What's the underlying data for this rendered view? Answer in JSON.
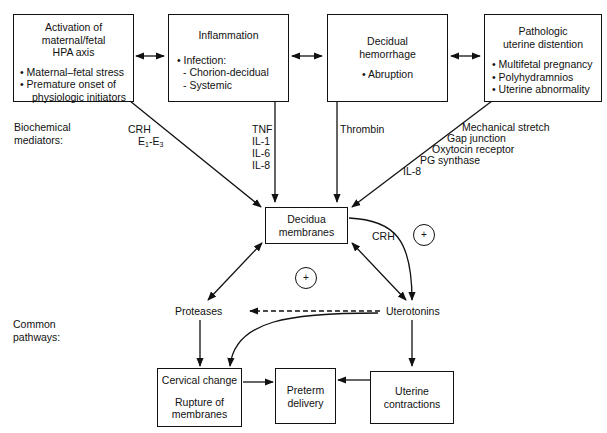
{
  "top_boxes": [
    {
      "title_lines": [
        "Activation of",
        "maternal/fetal",
        "HPA axis"
      ],
      "bullets": [
        "• Maternal–fetal stress",
        "• Premature onset of",
        "   physiologic initiators"
      ]
    },
    {
      "title_lines": [
        "Inflammation"
      ],
      "bullets": [
        "• Infection:",
        "  - Chorion-decidual",
        "  - Systemic"
      ]
    },
    {
      "title_lines": [
        "Decidual",
        "hemorrhage"
      ],
      "bullets": [
        "• Abruption"
      ]
    },
    {
      "title_lines": [
        "Pathologic",
        "uterine distention"
      ],
      "bullets": [
        "• Multifetal pregnancy",
        "• Polyhydramnios",
        "• Uterine abnormality"
      ]
    }
  ],
  "row_labels": {
    "biochemical": [
      "Biochemical",
      "mediators:"
    ],
    "common": [
      "Common",
      "pathways:"
    ]
  },
  "mediators": {
    "hpa": [
      "CRH",
      "E1-E3"
    ],
    "hpa_e_main": "E",
    "hpa_e_sub1": "1",
    "hpa_e_sep": "-E",
    "hpa_e_sub3": "3",
    "inflammation": [
      "TNF",
      "IL-1",
      "IL-6",
      "IL-8"
    ],
    "hemorrhage": [
      "Thrombin"
    ],
    "distention": [
      "Mechanical stretch",
      "Gap junction",
      "Oxytocin receptor",
      "PG synthase",
      "IL-8"
    ]
  },
  "central_box": {
    "lines": [
      "Decidua",
      "membranes"
    ]
  },
  "crh_label": "CRH",
  "plus_symbol": "+",
  "nodes": {
    "proteases": "Proteases",
    "uterotonins": "Uterotonins"
  },
  "bottom_boxes": {
    "cervical": {
      "line1": "Cervical change",
      "line2": "Rupture of",
      "line3": "membranes"
    },
    "preterm": {
      "lines": [
        "Preterm",
        "delivery"
      ]
    },
    "uterine": {
      "lines": [
        "Uterine",
        "contractions"
      ]
    }
  }
}
